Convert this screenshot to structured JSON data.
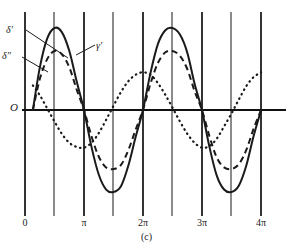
{
  "caption": "(c)",
  "origin_label": "O",
  "axis": {
    "x_axis_y": 110,
    "x_left": 22,
    "x_right": 286,
    "x_ticks": [
      {
        "label": "0",
        "x": 25
      },
      {
        "label": "π",
        "x": 84
      },
      {
        "label": "2π",
        "x": 143
      },
      {
        "label": "3π",
        "x": 202
      },
      {
        "label": "4π",
        "x": 261
      }
    ],
    "gridlines_x": [
      25,
      54,
      84,
      113,
      143,
      172,
      202,
      231,
      261
    ],
    "grid_top": 12,
    "grid_bottom": 208
  },
  "labels": {
    "delta_prime": "δ′",
    "delta_double_prime": "δ″",
    "gamma_prime": "γ′"
  },
  "leaders": [
    {
      "name": "delta-prime-leader",
      "x1": 26,
      "y1": 30,
      "x2": 68,
      "y2": 58
    },
    {
      "name": "delta-double-prime-leader",
      "x1": 22,
      "y1": 57,
      "x2": 48,
      "y2": 72
    },
    {
      "name": "gamma-prime-leader",
      "x1": 95,
      "y1": 45,
      "x2": 76,
      "y2": 55
    }
  ],
  "colors": {
    "ink": "#1a1a1a",
    "grid": "#2b2b2b",
    "axis": "#111111"
  },
  "chart_data": {
    "type": "line",
    "title": "",
    "xlabel": "",
    "ylabel": "",
    "xlim": [
      0,
      12.566
    ],
    "ylim": [
      -1.15,
      1.15
    ],
    "grid": true,
    "legend": "inline-annotations",
    "x_tick_values": [
      0,
      3.1416,
      6.2832,
      9.4248,
      12.5664
    ],
    "x_tick_labels": [
      "0",
      "π",
      "2π",
      "3π",
      "4π"
    ],
    "series": [
      {
        "name": "γ′",
        "style": "solid",
        "amplitude": 1.0,
        "phase_deg": 0,
        "period": 6.2832,
        "x_start": 0.42,
        "description": "largest-amplitude solid sinusoid, rises from origin near x=0.4",
        "x": [
          0.42,
          0.79,
          1.18,
          1.57,
          1.96,
          2.36,
          2.75,
          3.14,
          3.54,
          3.93,
          4.32,
          4.71,
          5.11,
          5.5,
          5.89,
          6.28,
          6.68,
          7.07,
          7.46,
          7.85,
          8.25,
          8.64,
          9.03,
          9.42,
          9.82,
          10.21,
          10.6,
          11.0,
          11.39,
          11.78,
          12.17,
          12.57
        ],
        "y": [
          0.0,
          0.52,
          0.87,
          1.0,
          0.95,
          0.72,
          0.35,
          0.0,
          -0.45,
          -0.79,
          -0.97,
          -1.0,
          -0.93,
          -0.68,
          -0.33,
          0.0,
          0.45,
          0.8,
          0.97,
          1.0,
          0.92,
          0.7,
          0.32,
          0.0,
          -0.45,
          -0.8,
          -0.97,
          -1.0,
          -0.92,
          -0.68,
          -0.32,
          0.0
        ]
      },
      {
        "name": "δ′",
        "style": "dashed",
        "amplitude": 0.72,
        "phase_deg": 0,
        "period": 6.2832,
        "x_start": 0.42,
        "description": "medium-amplitude dashed sinusoid, in phase with the solid curve",
        "x": [
          0.42,
          0.79,
          1.18,
          1.57,
          1.96,
          2.36,
          2.75,
          3.14,
          3.54,
          3.93,
          4.32,
          4.71,
          5.11,
          5.5,
          5.89,
          6.28,
          6.68,
          7.07,
          7.46,
          7.85,
          8.25,
          8.64,
          9.03,
          9.42,
          9.82,
          10.21,
          10.6,
          11.0,
          11.39,
          11.78,
          12.17,
          12.57
        ],
        "y": [
          0.0,
          0.38,
          0.62,
          0.72,
          0.68,
          0.52,
          0.25,
          0.0,
          -0.32,
          -0.57,
          -0.7,
          -0.72,
          -0.67,
          -0.49,
          -0.24,
          0.0,
          0.32,
          0.57,
          0.7,
          0.72,
          0.66,
          0.5,
          0.23,
          0.0,
          -0.32,
          -0.58,
          -0.7,
          -0.72,
          -0.66,
          -0.49,
          -0.23,
          0.0
        ]
      },
      {
        "name": "δ″",
        "style": "dotted",
        "amplitude": 0.46,
        "phase_deg": -60,
        "period": 6.2832,
        "x_start": 0.42,
        "description": "smallest-amplitude dotted sinusoid, lagging in phase",
        "x": [
          0.42,
          0.79,
          1.18,
          1.57,
          1.96,
          2.36,
          2.75,
          3.14,
          3.54,
          3.93,
          4.32,
          4.71,
          5.11,
          5.5,
          5.89,
          6.28,
          6.68,
          7.07,
          7.46,
          7.85,
          8.25,
          8.64,
          9.03,
          9.42,
          9.82,
          10.21,
          10.6,
          11.0,
          11.39,
          11.78,
          12.17,
          12.57
        ],
        "y": [
          0.3,
          0.18,
          0.02,
          -0.14,
          -0.29,
          -0.4,
          -0.45,
          -0.46,
          -0.4,
          -0.28,
          -0.12,
          0.05,
          0.22,
          0.35,
          0.43,
          0.46,
          0.43,
          0.33,
          0.19,
          0.03,
          -0.14,
          -0.29,
          -0.4,
          -0.46,
          -0.44,
          -0.35,
          -0.2,
          -0.04,
          0.13,
          0.29,
          0.4,
          0.46
        ]
      }
    ]
  }
}
